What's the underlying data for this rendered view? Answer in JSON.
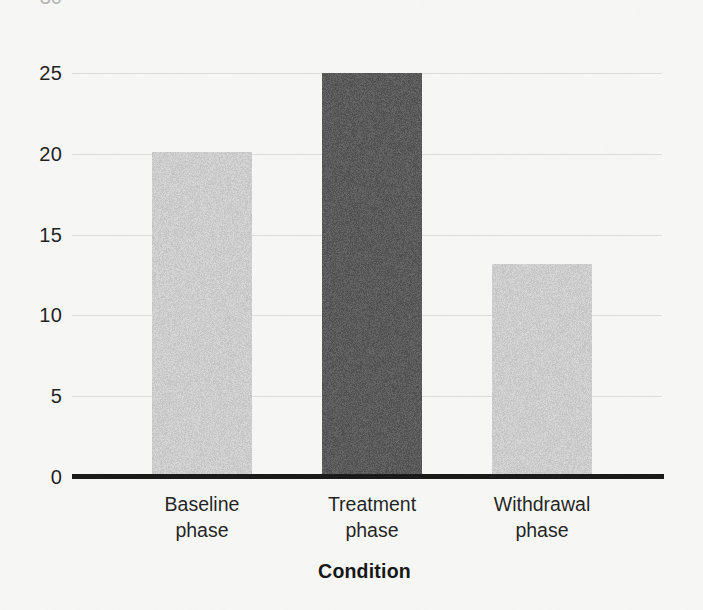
{
  "figure": {
    "background_color": "#fdfdfc",
    "axis_line_color": "#151515",
    "gridline_color": "#e2e2e2",
    "clipped_top_tick": "30"
  },
  "chart_data": {
    "type": "bar",
    "title": "",
    "subtitle": "",
    "xlabel": "Condition",
    "ylabel": "",
    "categories": [
      "Baseline phase",
      "Treatment phase",
      "Withdrawal phase"
    ],
    "category_lines": [
      [
        "Baseline",
        "phase"
      ],
      [
        "Treatment",
        "phase"
      ],
      [
        "Withdrawal",
        "phase"
      ]
    ],
    "values": [
      20.1,
      25.0,
      13.2
    ],
    "bar_colors": [
      "#d2d2d2",
      "#595959",
      "#d2d2d2"
    ],
    "ylim": [
      0,
      30
    ],
    "yticks": [
      0,
      5,
      10,
      15,
      20,
      25
    ],
    "ytick_labels": [
      "0",
      "5",
      "10",
      "15",
      "20",
      "25"
    ],
    "grid": "horizontal",
    "legend": "none",
    "annotations": []
  }
}
